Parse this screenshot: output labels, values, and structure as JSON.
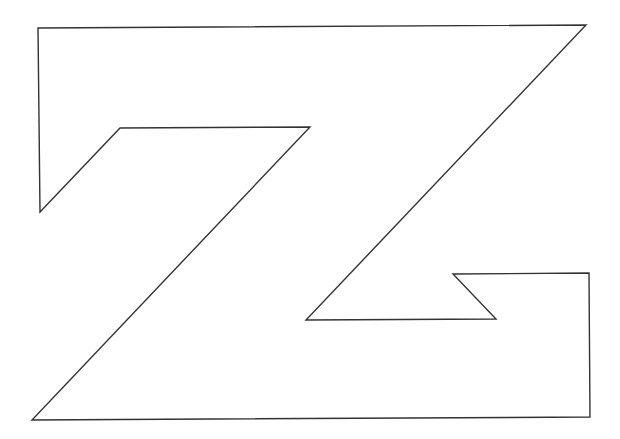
{
  "diagram": {
    "shape": "z-letter-outline",
    "stroke_color": "#333333",
    "fill_color": "#ffffff",
    "background": "#ffffff",
    "stroke_width": 1.4,
    "points": "38,28 586,25 306,320 496,319 453,274 589,273 590,417 32,420 310,127 120,128 40,212"
  }
}
